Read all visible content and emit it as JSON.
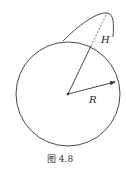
{
  "figure": {
    "caption": "图 4.8",
    "labels": {
      "height": "H",
      "radius": "R"
    },
    "circle": {
      "cx": 68,
      "cy": 94,
      "r": 52
    },
    "colors": {
      "stroke": "#333333",
      "background": "#ffffff"
    }
  }
}
